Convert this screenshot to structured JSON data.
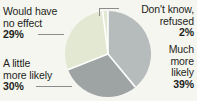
{
  "canvas": {
    "width": 197,
    "height": 101,
    "background_color": "#f6f6f1",
    "text_color": "#231f20",
    "leader_line_color": "#8c8c8c",
    "slice_separator_color": "#ffffff"
  },
  "labels": {
    "no_effect": {
      "line1": "Would have",
      "line2": "no effect",
      "pct": "29%"
    },
    "little_likely": {
      "line1": "A little",
      "line2": "more likely",
      "pct": "30%"
    },
    "dont_know": {
      "line1": "Don't know,",
      "line2": "refused",
      "pct": "2%"
    },
    "much_likely": {
      "line1": "Much",
      "line2": "more",
      "line3": "likely",
      "pct": "39%"
    }
  },
  "chart_data": {
    "type": "pie",
    "title": "",
    "subtitle": "",
    "xlabel": "",
    "ylabel": "",
    "legend_position": "callout-labels",
    "grid": false,
    "start_angle_deg": 0,
    "direction": "clockwise",
    "units": "percent",
    "total": 100,
    "categories": [
      "Much more likely",
      "A little more likely",
      "Would have no effect",
      "Don't know, refused"
    ],
    "values": [
      39,
      30,
      29,
      2
    ],
    "slices": [
      {
        "label": "Much more likely",
        "value": 39,
        "display": "39%",
        "color": "#b6bbbb",
        "start_deg": 0,
        "end_deg": 140.4
      },
      {
        "label": "A little more likely",
        "value": 30,
        "display": "30%",
        "color": "#9ea3a3",
        "start_deg": 140.4,
        "end_deg": 248.4
      },
      {
        "label": "Would have no effect",
        "value": 29,
        "display": "29%",
        "color": "#e2e8d2",
        "start_deg": 248.4,
        "end_deg": 352.8
      },
      {
        "label": "Don't know, refused",
        "value": 2,
        "display": "2%",
        "color": "#e2e8d2",
        "start_deg": 352.8,
        "end_deg": 360
      }
    ]
  }
}
